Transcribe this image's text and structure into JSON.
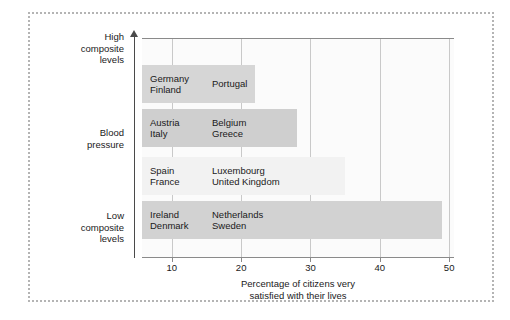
{
  "chart_data": {
    "type": "bar",
    "orientation": "horizontal",
    "title": "",
    "xlabel": "Percentage of citizens very satisfied with their lives",
    "ylabel": "Blood pressure",
    "xlim": [
      5.7,
      50.7
    ],
    "ylim_labels": [
      "High composite levels",
      "Low composite levels"
    ],
    "grid": true,
    "legend": "none",
    "xticks": [
      10,
      20,
      30,
      40,
      50
    ],
    "xticklabels": [
      "10",
      "20",
      "30",
      "40",
      "50"
    ],
    "categories": [
      "Germany Finland Portugal",
      "Austria Italy Belgium Greece",
      "Spain France Luxembourg United Kingdom",
      "Ireland Denmark Netherlands Sweden"
    ],
    "values": [
      22,
      28,
      35,
      49
    ],
    "bars": [
      {
        "value": 22,
        "col1": "Germany\nFinland",
        "col1_line1": "Germany",
        "col1_line2": "Finland",
        "col2_line1": "Portugal",
        "col2_line2": "",
        "color": "#d6d6d6"
      },
      {
        "value": 28,
        "col1_line1": "Austria",
        "col1_line2": "Italy",
        "col2_line1": "Belgium",
        "col2_line2": "Greece",
        "color": "#cfcfcf"
      },
      {
        "value": 35,
        "col1_line1": "Spain",
        "col1_line2": "France",
        "col2_line1": "Luxembourg",
        "col2_line2": "United Kingdom",
        "color": "#f2f2f2"
      },
      {
        "value": 49,
        "col1_line1": "Ireland",
        "col1_line2": "Denmark",
        "col2_line1": "Netherlands",
        "col2_line2": "Sweden",
        "color": "#d2d2d2"
      }
    ]
  },
  "axes": {
    "y_top_line1": "High",
    "y_top_line2": "composite",
    "y_top_line3": "levels",
    "y_mid_line1": "Blood",
    "y_mid_line2": "pressure",
    "y_bottom_line1": "Low",
    "y_bottom_line2": "composite",
    "y_bottom_line3": "levels",
    "x_title_line1": "Percentage of citizens very",
    "x_title_line2": "satisfied with their lives"
  },
  "style": {
    "frame_color": "#b4b4b4",
    "axis_color": "#4a4a4a",
    "grid_color": "#c9c9c9",
    "plot_bg": "#fbfbfb",
    "text_color": "#1a1a1a"
  }
}
